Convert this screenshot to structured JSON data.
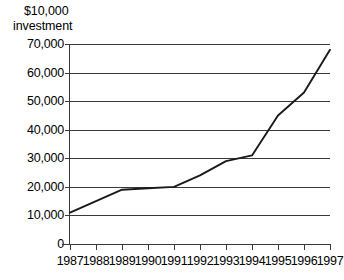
{
  "chart_data": {
    "type": "line",
    "title": "$10,000 investment",
    "title_lines": [
      "$10,000",
      "investment"
    ],
    "xlabel": "",
    "ylabel": "",
    "xlim": [
      1987,
      1997
    ],
    "ylim": [
      0,
      70000
    ],
    "grid": true,
    "legend": "none",
    "x": [
      1987,
      1988,
      1989,
      1990,
      1991,
      1992,
      1993,
      1994,
      1995,
      1996,
      1997
    ],
    "categories": [
      "1987",
      "1988",
      "1989",
      "1990",
      "1991",
      "1992",
      "1993",
      "1994",
      "1995",
      "1996",
      "1997"
    ],
    "values": [
      11000,
      15000,
      19000,
      19500,
      20000,
      24000,
      29000,
      31000,
      45000,
      53000,
      68000
    ],
    "series": [
      {
        "name": "$10,000 investment",
        "color": "#1a1a1a",
        "values": [
          11000,
          15000,
          19000,
          19500,
          20000,
          24000,
          29000,
          31000,
          45000,
          53000,
          68000
        ]
      }
    ],
    "y_ticks": [
      {
        "value": 70000,
        "label": "70,000"
      },
      {
        "value": 60000,
        "label": "60,000"
      },
      {
        "value": 50000,
        "label": "50,000"
      },
      {
        "value": 40000,
        "label": "40,000"
      },
      {
        "value": 30000,
        "label": "30,000"
      },
      {
        "value": 20000,
        "label": "20,000"
      },
      {
        "value": 10000,
        "label": "10,000"
      },
      {
        "value": 0,
        "label": "0"
      }
    ],
    "x_ticks": [
      {
        "value": 1987,
        "label": "1987"
      },
      {
        "value": 1988,
        "label": "1988"
      },
      {
        "value": 1989,
        "label": "1989"
      },
      {
        "value": 1990,
        "label": "1990"
      },
      {
        "value": 1991,
        "label": "1991"
      },
      {
        "value": 1992,
        "label": "1992"
      },
      {
        "value": 1993,
        "label": "1993"
      },
      {
        "value": 1994,
        "label": "1994"
      },
      {
        "value": 1995,
        "label": "1995"
      },
      {
        "value": 1996,
        "label": "1996"
      },
      {
        "value": 1997,
        "label": "1997"
      }
    ],
    "colors": {
      "line": "#1a1a1a",
      "grid": "#3a3a3a",
      "axis": "#3a3a3a",
      "background": "#ffffff",
      "text": "#000000"
    }
  }
}
